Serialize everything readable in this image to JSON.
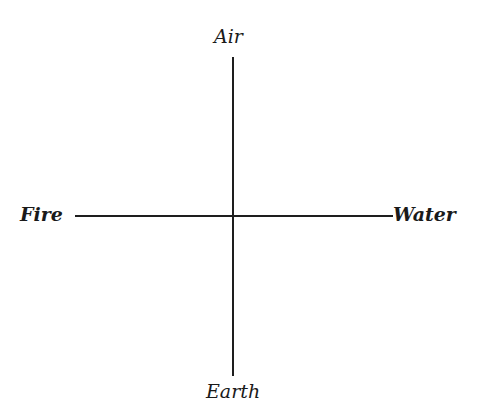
{
  "diagram": {
    "type": "cross-axis",
    "labels": {
      "top": "Air",
      "left": "Fire",
      "right": "Water",
      "bottom": "Earth"
    },
    "colors": {
      "line": "#1e1e1e",
      "text": "#1a1a1a",
      "background": "#ffffff"
    }
  }
}
